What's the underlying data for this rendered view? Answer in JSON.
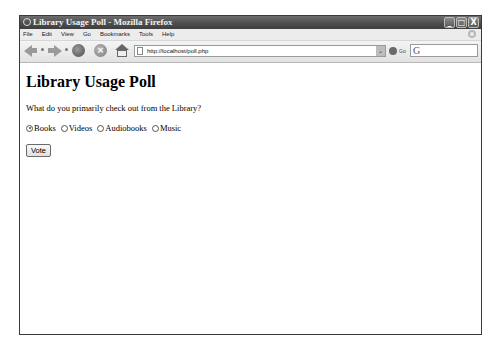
{
  "window": {
    "title": "Library Usage Poll - Mozilla Firefox",
    "controls": {
      "minimize": "_",
      "maximize": "□",
      "close": "X"
    }
  },
  "menu": {
    "items": [
      {
        "label": "File",
        "accel": "F"
      },
      {
        "label": "Edit",
        "accel": "E"
      },
      {
        "label": "View",
        "accel": "V"
      },
      {
        "label": "Go",
        "accel": "G"
      },
      {
        "label": "Bookmarks",
        "accel": "B"
      },
      {
        "label": "Tools",
        "accel": "T"
      },
      {
        "label": "Help",
        "accel": "H"
      }
    ]
  },
  "navbar": {
    "url": "http://localhost/poll.php",
    "go_label": "Go",
    "search_glyph": "G",
    "dropdown_glyph": "⌄",
    "stop_glyph": "×"
  },
  "page": {
    "heading": "Library Usage Poll",
    "question": "What do you primarily check out from the Library?",
    "options": [
      {
        "label": "Books",
        "checked": true
      },
      {
        "label": "Videos",
        "checked": false
      },
      {
        "label": "Audiobooks",
        "checked": false
      },
      {
        "label": "Music",
        "checked": false
      }
    ],
    "submit_label": "Vote"
  }
}
